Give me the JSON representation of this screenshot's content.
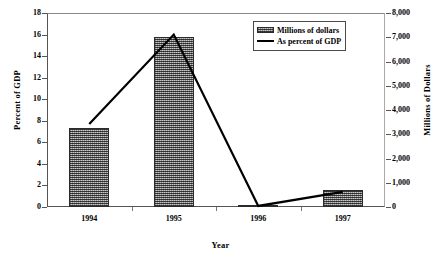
{
  "chart_data": {
    "type": "bar",
    "title": "",
    "xlabel": "Year",
    "ylabel": "Percent of GDP",
    "y2label": "Millions of Dollars",
    "categories": [
      "1994",
      "1995",
      "1996",
      "1997"
    ],
    "grid": false,
    "legend_position": "top-right",
    "left_axis": {
      "label": "Percent of GDP",
      "min": 0,
      "max": 18,
      "step": 2,
      "ticks": [
        "0",
        "2",
        "4",
        "6",
        "8",
        "10",
        "12",
        "14",
        "16",
        "18"
      ],
      "tick_values": [
        0,
        2,
        4,
        6,
        8,
        10,
        12,
        14,
        16,
        18
      ]
    },
    "right_axis": {
      "label": "Millions of Dollars",
      "min": 0,
      "max": 8000,
      "step": 1000,
      "ticks": [
        "0",
        "1,000",
        "2,000",
        "3,000",
        "4,000",
        "5,000",
        "6,000",
        "7,000",
        "8,000"
      ],
      "tick_values": [
        0,
        1000,
        2000,
        3000,
        4000,
        5000,
        6000,
        7000,
        8000
      ]
    },
    "series": [
      {
        "name": "Millions of dollars",
        "type": "bar",
        "axis": "right",
        "values": [
          3250,
          7000,
          80,
          700
        ],
        "left_axis_equivalent": [
          7.3,
          15.8,
          0.2,
          1.6
        ],
        "color": "#8c8c8c",
        "pattern": "fine-dotted-gray"
      },
      {
        "name": "As percent of GDP",
        "type": "line",
        "axis": "left",
        "values": [
          7.7,
          16.0,
          0.1,
          1.4
        ],
        "color": "#000000"
      }
    ]
  },
  "legend": {
    "items": [
      {
        "label": "Millions of dollars",
        "swatch": "bar-swatch"
      },
      {
        "label": "As percent of GDP",
        "swatch": "line-swatch"
      }
    ]
  }
}
